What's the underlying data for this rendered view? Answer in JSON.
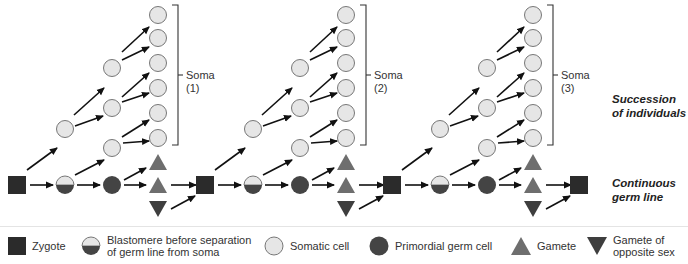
{
  "colors": {
    "zygote": "#2b2b2b",
    "somatic_fill": "#e6e6e6",
    "somatic_stroke": "#777777",
    "germ": "#444444",
    "gamete": "#6e6e6e",
    "gamete_opposite": "#3e3e3e",
    "arrow": "#111111"
  },
  "labels": {
    "succession": [
      "Succession",
      "of individuals"
    ],
    "germline": [
      "Continuous",
      "germ line"
    ]
  },
  "soma": [
    {
      "name": "Soma",
      "num": "(1)"
    },
    {
      "name": "Soma",
      "num": "(2)"
    },
    {
      "name": "Soma",
      "num": "(3)"
    }
  ],
  "legend": [
    {
      "icon": "zygote-square-icon",
      "text": [
        "Zygote"
      ]
    },
    {
      "icon": "blastomere-half-circle-icon",
      "text": [
        "Blastomere before separation",
        "of germ line from soma"
      ]
    },
    {
      "icon": "somatic-circle-icon",
      "text": [
        "Somatic cell"
      ]
    },
    {
      "icon": "primordial-germ-circle-icon",
      "text": [
        "Primordial germ cell"
      ]
    },
    {
      "icon": "gamete-triangle-icon",
      "text": [
        "Gamete"
      ]
    },
    {
      "icon": "gamete-opposite-triangle-icon",
      "text": [
        "Gamete of",
        "opposite sex"
      ]
    }
  ]
}
